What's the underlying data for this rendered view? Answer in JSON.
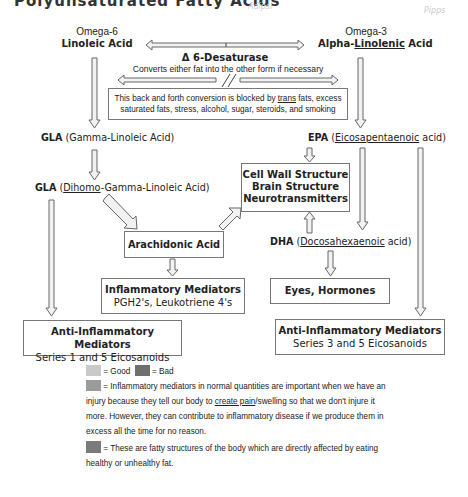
{
  "header": {
    "title_cut": "Polyunsaturated Fatty Acids",
    "faint_top_right_1": "Adipsi",
    "faint_top_right_2": "Pipps"
  },
  "omega6": {
    "label_top": "Omega-6",
    "label_main": "Linoleic Acid"
  },
  "omega3": {
    "label_top": "Omega-3",
    "label_main_prefix": "Alpha-",
    "label_main_underlined": "Linolenic",
    "label_main_suffix": " Acid"
  },
  "desaturase": {
    "title": "Δ 6-Desaturase",
    "subtitle": "Converts either fat into the other form if necessary",
    "break_symbol": "//"
  },
  "blocked_box": {
    "line1_prefix": "This back and forth conversion is blocked by ",
    "line1_underlined": "trans",
    "line1_suffix": " fats, excess",
    "line2": "saturated fats, stress, alcohol, sugar, steroids, and smoking"
  },
  "gla": {
    "abbr": "GLA",
    "full": " (Gamma-Linoleic Acid)"
  },
  "dgla": {
    "abbr": "GLA",
    "paren_open": " (",
    "underlined": "Dihomo",
    "rest": "-Gamma-Linoleic Acid)"
  },
  "epa": {
    "abbr": "EPA",
    "paren_open": " (",
    "underlined": "Eicosapentaenoic",
    "rest": " acid)"
  },
  "dha": {
    "abbr": "DHA",
    "paren_open": " (",
    "underlined": "Docosahexaenoic",
    "rest": " acid)"
  },
  "cell_box": {
    "line1": "Cell Wall Structure",
    "line2": "Brain Structure",
    "line3": "Neurotransmitters"
  },
  "arachidonic_box": {
    "label": "Arachidonic Acid"
  },
  "inflammatory_box": {
    "title": "Inflammatory Mediators",
    "subtitle": "PGH2's, Leukotriene 4's"
  },
  "eyes_box": {
    "label": "Eyes, Hormones"
  },
  "anti_left_box": {
    "title": "Anti-Inflammatory Mediators",
    "subtitle": "Series 1 and 5 Eicosanoids"
  },
  "anti_right_box": {
    "title": "Anti-Inflammatory Mediators",
    "subtitle": "Series 3 and 5 Eicosanoids"
  },
  "legend": {
    "good_label": "= Good",
    "bad_label": "= Bad",
    "inflammatory_text_1": "= Inflammatory mediators in normal quantities are important when we have an",
    "inflammatory_text_2_prefix": "injury because they tell our body to ",
    "inflammatory_text_2_underlined": "create  pain",
    "inflammatory_text_2_suffix": "/swelling so that we don't injure it",
    "inflammatory_text_3": "more. However, they can contribute to inflammatory disease if we produce them in",
    "inflammatory_text_4": "excess all the time for no reason.",
    "fatty_text_1": "= These are fatty structures of the body which are directly affected by eating",
    "fatty_text_2": "healthy or unhealthy fat.",
    "colors": {
      "good": "#c9c9c9",
      "bad": "#6f6f6f",
      "inflammatory": "#9b9b9b",
      "fatty": "#7b7b7b"
    }
  }
}
